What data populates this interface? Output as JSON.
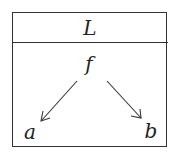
{
  "diagram": {
    "header_label": "L",
    "root_node": "f",
    "children": [
      {
        "label": "a"
      },
      {
        "label": "b"
      }
    ],
    "edges": [
      {
        "from": "f",
        "to": "a"
      },
      {
        "from": "f",
        "to": "b"
      }
    ]
  }
}
